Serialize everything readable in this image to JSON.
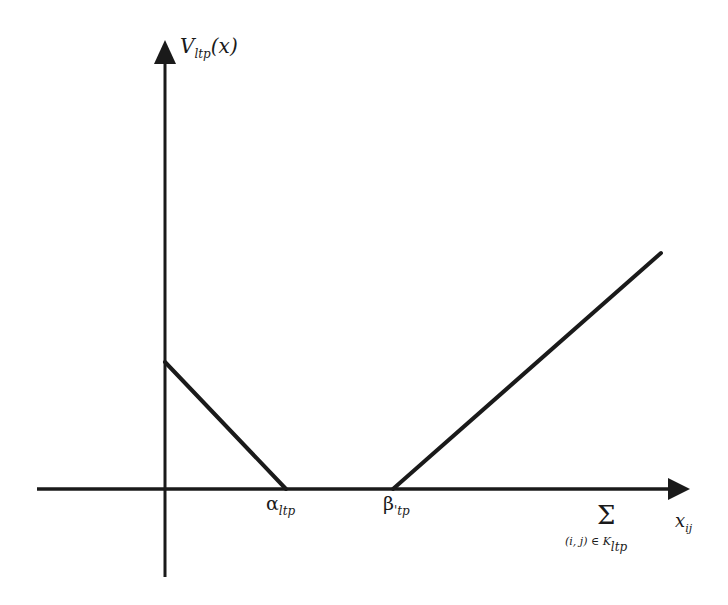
{
  "diagram": {
    "type": "piecewise-linear function plot",
    "y_axis": {
      "label_main": "V",
      "label_sub": "ltp",
      "label_arg": "(x)"
    },
    "x_axis": {
      "sum_symbol": "Σ",
      "sum_index": "(i, j) ∈ K",
      "sum_index_sub": "ltp",
      "term_main": "x",
      "term_sub": "ij"
    },
    "ticks": [
      {
        "main": "α",
        "sub": "ltp"
      },
      {
        "main": "β",
        "sub": "'tp"
      }
    ],
    "segments": [
      {
        "name": "decreasing-segment",
        "from": [
          0,
          "high"
        ],
        "to": [
          "alpha_ltp",
          0
        ]
      },
      {
        "name": "flat-segment",
        "from": [
          "alpha_ltp",
          0
        ],
        "to": [
          "beta_ltp",
          0
        ]
      },
      {
        "name": "increasing-segment",
        "from": [
          "beta_ltp",
          0
        ],
        "to": [
          "far-right",
          "high"
        ]
      }
    ],
    "colors": {
      "line": "#1a1a1a",
      "background": "#ffffff"
    }
  }
}
